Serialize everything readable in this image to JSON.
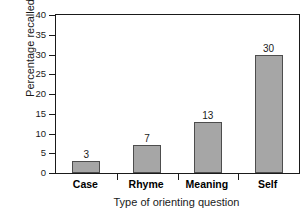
{
  "chart_data": {
    "type": "bar",
    "title": "",
    "subtitle": "",
    "xlabel": "Type of orienting question",
    "ylabel": "Percentage recalled",
    "categories": [
      "Case",
      "Rhyme",
      "Meaning",
      "Self"
    ],
    "values": [
      3,
      7,
      13,
      30
    ],
    "value_labels": [
      "3",
      "7",
      "13",
      "30"
    ],
    "ylim": [
      0,
      40
    ],
    "ytick_values": [
      0,
      5,
      10,
      15,
      20,
      25,
      30,
      35,
      40
    ],
    "ytick_labels": [
      "0",
      "5",
      "10",
      "15",
      "20",
      "25",
      "30",
      "35",
      "40"
    ],
    "grid": false,
    "legend": null,
    "legend_position": "none",
    "bar_color": "#a6a6a6",
    "bar_edge_color": "#4d4d4d",
    "axis_color": "#1a1a1a",
    "background": "#ffffff"
  }
}
